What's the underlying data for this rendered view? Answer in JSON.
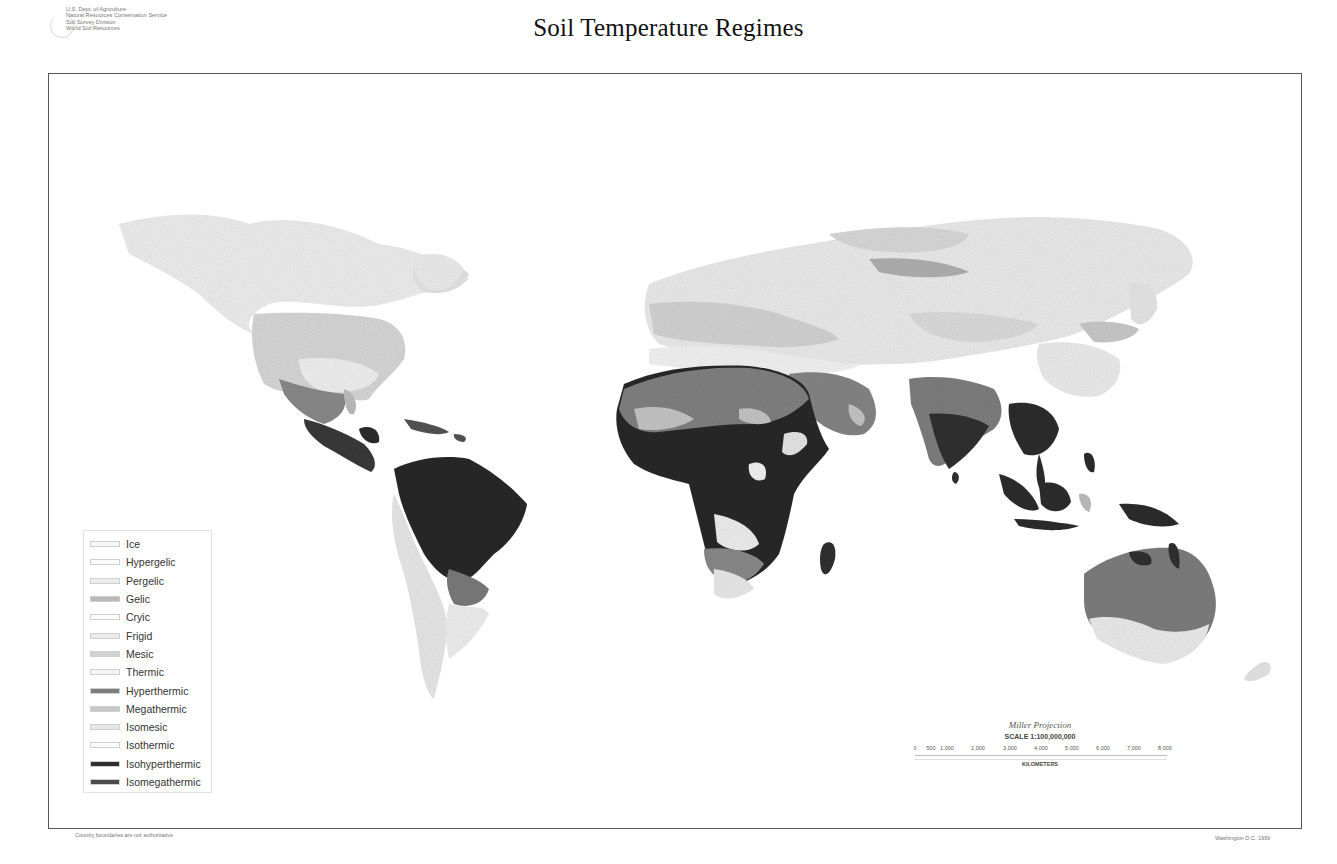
{
  "header": {
    "agency_lines": [
      "U.S. Dept. of Agriculture",
      "Natural Resources Conservation Service",
      "Soil Survey Division",
      "World Soil Resources"
    ],
    "title": "Soil Temperature Regimes"
  },
  "legend": {
    "items": [
      {
        "label": "Ice",
        "color": "#f7f7f7"
      },
      {
        "label": "Hypergelic",
        "color": "#fbfbfb"
      },
      {
        "label": "Pergelic",
        "color": "#ececec"
      },
      {
        "label": "Gelic",
        "color": "#b9b9b9"
      },
      {
        "label": "Cryic",
        "color": "#fcfcfc"
      },
      {
        "label": "Frigid",
        "color": "#ebebeb"
      },
      {
        "label": "Mesic",
        "color": "#d2d2d2"
      },
      {
        "label": "Thermic",
        "color": "#f4f4f4"
      },
      {
        "label": "Hyperthermic",
        "color": "#7d7d7d"
      },
      {
        "label": "Megathermic",
        "color": "#c7c7c7"
      },
      {
        "label": "Isomesic",
        "color": "#e6e6e6"
      },
      {
        "label": "Isothermic",
        "color": "#fafafa"
      },
      {
        "label": "Isohyperthermic",
        "color": "#2e2e2e"
      },
      {
        "label": "Isomegathermic",
        "color": "#4a4a4a"
      }
    ]
  },
  "scale": {
    "projection": "Miller Projection",
    "ratio": "SCALE 1:100,000,000",
    "ticks": [
      "0",
      "500",
      "1,000",
      "2,000",
      "3,000",
      "4,000",
      "5,000",
      "6,000",
      "7,000",
      "8,000"
    ],
    "unit": "KILOMETERS"
  },
  "footer": {
    "left": "Country boundaries are not authoritative",
    "right": "Washington D.C. 1999"
  }
}
